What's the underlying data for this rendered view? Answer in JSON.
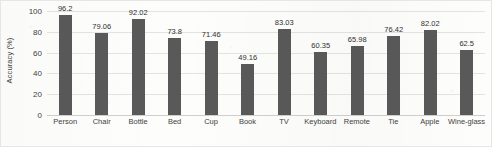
{
  "chart_data": {
    "type": "bar",
    "title": "",
    "xlabel": "",
    "ylabel": "Accuracy (%)",
    "ylim": [
      0,
      100
    ],
    "yticks": [
      0,
      20,
      40,
      60,
      80,
      100
    ],
    "ytick_labels": [
      "0",
      "20",
      "40",
      "60",
      "80",
      "100"
    ],
    "grid": "horizontal",
    "legend": "none",
    "bar_color": "#595959",
    "gridline_color": "#e3e3e1",
    "background_color": "#ffffff",
    "categories": [
      "Person",
      "Chair",
      "Bottle",
      "Bed",
      "Cup",
      "Book",
      "TV",
      "Keyboard",
      "Remote",
      "Tie",
      "Apple",
      "Wine-glass"
    ],
    "values": [
      96.2,
      79.06,
      92.02,
      73.8,
      71.46,
      49.16,
      83.03,
      60.35,
      65.98,
      76.42,
      82.02,
      62.5
    ],
    "value_labels": [
      "96.2",
      "79.06",
      "92.02",
      "73.8",
      "71.46",
      "49.16",
      "83.03",
      "60.35",
      "65.98",
      "76.42",
      "82.02",
      "62.5"
    ]
  }
}
